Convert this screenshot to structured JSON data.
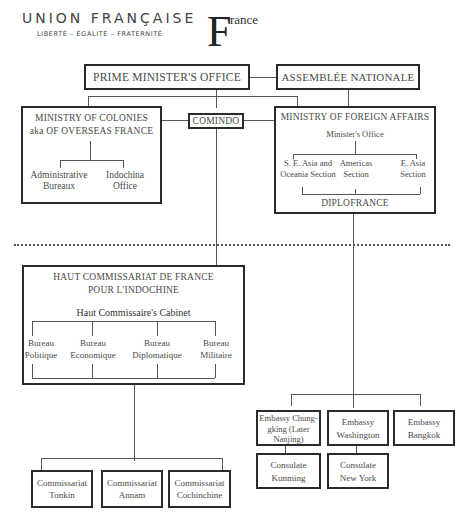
{
  "header": {
    "union_title": "UNION FRANÇAISE",
    "motto": "LIBERTÉ – ÉGALITÉ – FRATERNITÉ",
    "logo_letter": "F",
    "logo_rest": "rance"
  },
  "top": {
    "prime_minister": "PRIME MINISTER'S OFFICE",
    "assemblee": "ASSEMBLÉE NATIONALE",
    "comindo": "COMINDO"
  },
  "colonies": {
    "title_line1": "MINISTRY OF COLONIES",
    "title_line2": "aka OF OVERSEAS FRANCE",
    "children": [
      {
        "line1": "Administrative",
        "line2": "Bureaux"
      },
      {
        "line1": "Indochina",
        "line2": "Office"
      }
    ]
  },
  "foreign_affairs": {
    "title": "MINISTRY OF FOREIGN AFFAIRS",
    "office": "Minister's Office",
    "sections": [
      {
        "line1": "S. E. Asia and",
        "line2": "Oceania Section"
      },
      {
        "line1": "Americas",
        "line2": "Section"
      },
      {
        "line1": "E. Asia",
        "line2": "Section"
      }
    ],
    "diplofrance": "DIPLOFRANCE"
  },
  "haut_commissariat": {
    "title_line1": "HAUT COMMISSARIAT DE FRANCE",
    "title_line2": "POUR L'INDOCHINE",
    "cabinet": "Haut Commissaire's Cabinet",
    "bureaux": [
      {
        "line1": "Bureau",
        "line2": "Politique"
      },
      {
        "line1": "Bureau",
        "line2": "Economique"
      },
      {
        "line1": "Bureau",
        "line2": "Diplomatique"
      },
      {
        "line1": "Bureau",
        "line2": "Militaire"
      }
    ]
  },
  "commissariats": [
    {
      "line1": "Commissariat",
      "line2": "Tonkin"
    },
    {
      "line1": "Commissariat",
      "line2": "Annam"
    },
    {
      "line1": "Commissariat",
      "line2": "Cochinchine"
    }
  ],
  "embassies": [
    {
      "line1": "Embassy Chung-",
      "line2": "gking (Later",
      "line3": "Nanjing)"
    },
    {
      "line1": "Embassy",
      "line2": "Washington"
    },
    {
      "line1": "Embassy",
      "line2": "Bangkok"
    }
  ],
  "consulates": [
    {
      "line1": "Consulate",
      "line2": "Kunming"
    },
    {
      "line1": "Consulate",
      "line2": "New York"
    }
  ]
}
